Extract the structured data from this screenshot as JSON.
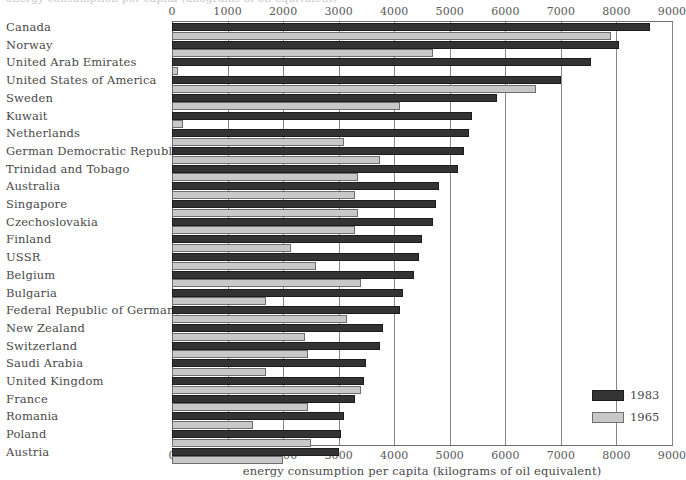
{
  "top_caption": "energy consumption per capita (kilograms of oil equivalent)",
  "axis": {
    "title": "energy consumption per capita (kilograms of oil equivalent)",
    "ticks": [
      "0",
      "1000",
      "2000",
      "3000",
      "4000",
      "5000",
      "6000",
      "7000",
      "8000",
      "9000"
    ]
  },
  "legend": {
    "position": "bottom-right",
    "entries": [
      {
        "label": "1983",
        "color": "#333333"
      },
      {
        "label": "1965",
        "color": "#c8c8c8"
      }
    ]
  },
  "colors": {
    "bar_1983": "#333333",
    "bar_1965": "#c8c8c8",
    "gridline": "#888888",
    "text": "#4a4a4a"
  },
  "chart_data": {
    "type": "bar",
    "orientation": "horizontal",
    "title": "",
    "subtitle": "",
    "xlabel": "energy consumption per capita (kilograms of oil equivalent)",
    "ylabel": "",
    "xlim": [
      0,
      9000
    ],
    "grid": true,
    "xticks": [
      0,
      1000,
      2000,
      3000,
      4000,
      5000,
      6000,
      7000,
      8000,
      9000
    ],
    "legend_position": "bottom-right",
    "categories": [
      "Canada",
      "Norway",
      "United Arab Emirates",
      "United States of America",
      "Sweden",
      "Kuwait",
      "Netherlands",
      "German Democratic Republic",
      "Trinidad and Tobago",
      "Australia",
      "Singapore",
      "Czechoslovakia",
      "Finland",
      "USSR",
      "Belgium",
      "Bulgaria",
      "Federal Republic of Germany",
      "New Zealand",
      "Switzerland",
      "Saudi Arabia",
      "United Kingdom",
      "France",
      "Romania",
      "Poland",
      "Austria"
    ],
    "series": [
      {
        "name": "1983",
        "color": "#333333",
        "values": [
          8600,
          8050,
          7550,
          7000,
          5850,
          5400,
          5350,
          5250,
          5150,
          4800,
          4750,
          4700,
          4500,
          4450,
          4350,
          4150,
          4100,
          3800,
          3750,
          3500,
          3450,
          3300,
          3100,
          3050,
          3000
        ]
      },
      {
        "name": "1965",
        "color": "#c8c8c8",
        "values": [
          7900,
          4700,
          100,
          6550,
          4100,
          200,
          3100,
          3750,
          3350,
          3300,
          3350,
          3300,
          2150,
          2600,
          3400,
          1700,
          3150,
          2400,
          2450,
          1700,
          3400,
          2450,
          1450,
          2500,
          2000
        ]
      }
    ]
  }
}
